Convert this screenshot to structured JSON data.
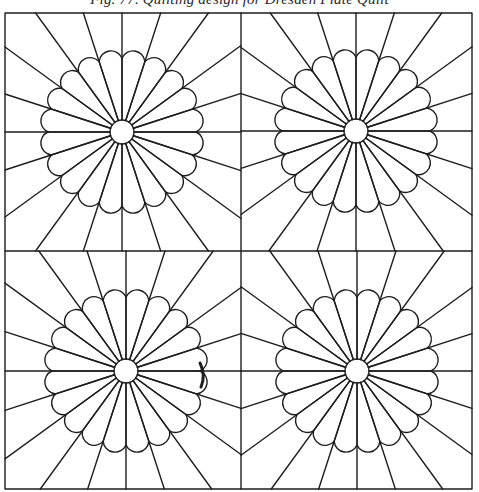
{
  "figure": {
    "caption": "Fig. 77. Quilting design for Dresden Plate Quilt",
    "ink_color": "#1e1e1e",
    "stroke_width": 1.4,
    "frame": {
      "left": 5,
      "top": 13,
      "right": 472,
      "bottom": 489
    },
    "midlines": {
      "x": 241,
      "y": 251
    },
    "rosette": {
      "petal_count": 20,
      "center_radius": 12,
      "petal_outer_radius": 82,
      "petal_valley_radius": 74
    },
    "blocks": [
      {
        "name": "top-left",
        "cx": 122,
        "cy": 132,
        "bounds": [
          5,
          13,
          241,
          251
        ]
      },
      {
        "name": "top-right",
        "cx": 356,
        "cy": 131,
        "bounds": [
          241,
          13,
          472,
          251
        ]
      },
      {
        "name": "bottom-left",
        "cx": 126,
        "cy": 371,
        "bounds": [
          5,
          251,
          241,
          489
        ]
      },
      {
        "name": "bottom-right",
        "cx": 357,
        "cy": 371,
        "bounds": [
          241,
          251,
          472,
          489
        ]
      }
    ],
    "artifact": {
      "x": 203,
      "y": 375,
      "description": "heavy ink stroke on petal edge"
    }
  }
}
